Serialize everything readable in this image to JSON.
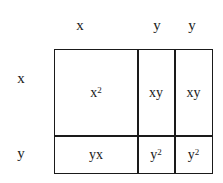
{
  "diagram": {
    "type": "area-model",
    "column_labels": [
      "x",
      "y",
      "y"
    ],
    "row_labels": [
      "x",
      "y"
    ],
    "cells": [
      [
        {
          "base": "x",
          "exp": "2"
        },
        {
          "base": "xy",
          "exp": ""
        },
        {
          "base": "xy",
          "exp": ""
        }
      ],
      [
        {
          "base": "yx",
          "exp": ""
        },
        {
          "base": "y",
          "exp": "2"
        },
        {
          "base": "y",
          "exp": "2"
        }
      ]
    ],
    "colors": {
      "line": "#1a1a1a",
      "background": "#ffffff"
    }
  }
}
